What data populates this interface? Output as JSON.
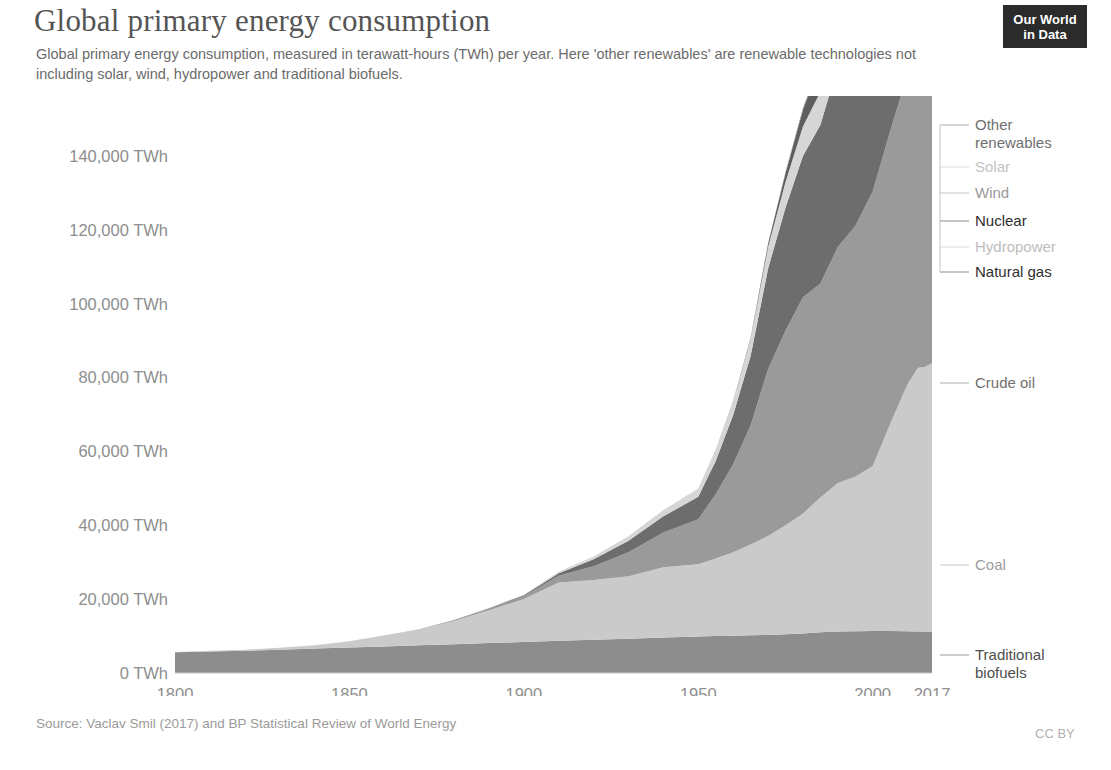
{
  "header": {
    "title": "Global primary energy consumption",
    "subtitle": "Global primary energy consumption, measured in terawatt-hours (TWh) per year. Here 'other renewables' are renewable technologies not including solar, wind, hydropower and traditional biofuels.",
    "logo_line1": "Our World",
    "logo_line2": "in Data"
  },
  "footer": {
    "source": "Source: Vaclav Smil (2017) and BP Statistical Review of World Energy",
    "license": "CC BY"
  },
  "chart_data": {
    "type": "area",
    "title": "Global primary energy consumption",
    "xlabel": "",
    "ylabel": "TWh",
    "xlim": [
      1800,
      2017
    ],
    "ylim": [
      0,
      148000
    ],
    "grid": false,
    "legend_position": "right-inline",
    "ytick_labels": [
      "0 TWh",
      "20,000 TWh",
      "40,000 TWh",
      "60,000 TWh",
      "80,000 TWh",
      "100,000 TWh",
      "120,000 TWh",
      "140,000 TWh"
    ],
    "ytick_values": [
      0,
      20000,
      40000,
      60000,
      80000,
      100000,
      120000,
      140000
    ],
    "xtick_labels": [
      "1800",
      "1850",
      "1900",
      "1950",
      "2000",
      "2017"
    ],
    "xtick_values": [
      1800,
      1850,
      1900,
      1950,
      2000,
      2017
    ],
    "x": [
      1800,
      1810,
      1820,
      1830,
      1840,
      1850,
      1860,
      1870,
      1880,
      1890,
      1900,
      1910,
      1920,
      1930,
      1940,
      1950,
      1955,
      1960,
      1965,
      1970,
      1975,
      1980,
      1985,
      1990,
      1995,
      2000,
      2005,
      2010,
      2013,
      2015,
      2017
    ],
    "series": [
      {
        "name": "Traditional biofuels",
        "color": "#8d8d8d",
        "label_color": "#4d4d4d",
        "values": [
          5600,
          5800,
          6000,
          6300,
          6600,
          6900,
          7200,
          7500,
          7800,
          8100,
          8400,
          8700,
          9000,
          9300,
          9600,
          9900,
          10000,
          10100,
          10200,
          10300,
          10500,
          10700,
          11000,
          11200,
          11300,
          11400,
          11400,
          11300,
          11200,
          11200,
          11200
        ]
      },
      {
        "name": "Coal",
        "color": "#cacaca",
        "label_color": "#9a9a9a",
        "values": [
          97,
          200,
          320,
          520,
          900,
          1700,
          2900,
          4300,
          6300,
          8900,
          11600,
          15800,
          16200,
          16900,
          19000,
          19500,
          21000,
          22600,
          24600,
          26800,
          29500,
          32500,
          36500,
          40200,
          41800,
          44600,
          56000,
          66900,
          71400,
          71600,
          72700
        ]
      },
      {
        "name": "Crude oil",
        "color": "#9a9a9a",
        "label_color": "#7a7a7a",
        "values": [
          0,
          0,
          0,
          0,
          0,
          0,
          30,
          60,
          180,
          420,
          800,
          1800,
          3700,
          6500,
          9400,
          12200,
          17400,
          23800,
          32200,
          45100,
          52600,
          58500,
          57900,
          63900,
          67900,
          74300,
          79200,
          83900,
          87700,
          89800,
          93100
        ]
      },
      {
        "name": "Natural gas",
        "color": "#6d6d6d",
        "label_color": "#3f3f3f",
        "values": [
          0,
          0,
          0,
          0,
          0,
          0,
          0,
          10,
          40,
          110,
          260,
          700,
          1900,
          3100,
          4400,
          6100,
          9000,
          13300,
          18800,
          27200,
          33300,
          38200,
          42900,
          49000,
          52700,
          58200,
          64200,
          72700,
          75900,
          77300,
          81200
        ]
      },
      {
        "name": "Hydropower",
        "color": "#d6d6d6",
        "label_color": "#b9b9b9",
        "values": [
          0,
          0,
          0,
          0,
          0,
          0,
          0,
          0,
          10,
          40,
          140,
          380,
          700,
          1200,
          1700,
          2200,
          2900,
          3700,
          4500,
          5800,
          7000,
          8000,
          9000,
          10200,
          11000,
          11900,
          12800,
          14900,
          15800,
          16200,
          16800
        ]
      },
      {
        "name": "Nuclear",
        "color": "#5e5e5e",
        "label_color": "#2e2e2e",
        "values": [
          0,
          0,
          0,
          0,
          0,
          0,
          0,
          0,
          0,
          0,
          0,
          0,
          0,
          0,
          0,
          0,
          20,
          90,
          300,
          900,
          2300,
          4500,
          7400,
          9800,
          11000,
          11900,
          12500,
          12300,
          11200,
          11400,
          11500
        ]
      },
      {
        "name": "Wind",
        "color": "#b4b4b4",
        "label_color": "#8e8e8e",
        "values": [
          0,
          0,
          0,
          0,
          0,
          0,
          0,
          0,
          0,
          0,
          0,
          0,
          0,
          0,
          0,
          0,
          0,
          0,
          0,
          0,
          0,
          0,
          10,
          30,
          80,
          200,
          600,
          1700,
          3000,
          4100,
          5400
        ]
      },
      {
        "name": "Solar",
        "color": "#dcdcdc",
        "label_color": "#c3c3c3",
        "values": [
          0,
          0,
          0,
          0,
          0,
          0,
          0,
          0,
          0,
          0,
          0,
          0,
          0,
          0,
          0,
          0,
          0,
          0,
          0,
          0,
          0,
          0,
          0,
          0,
          5,
          10,
          40,
          200,
          700,
          1500,
          2400
        ]
      },
      {
        "name": "Other renewables",
        "color": "#8a8a8a",
        "label_color": "#6f6f6f",
        "values": [
          0,
          0,
          0,
          0,
          0,
          0,
          0,
          0,
          0,
          0,
          0,
          0,
          0,
          0,
          0,
          0,
          0,
          0,
          60,
          150,
          300,
          500,
          800,
          1200,
          1600,
          2100,
          2800,
          3800,
          4600,
          5200,
          6000
        ]
      }
    ],
    "legend_entries": [
      {
        "label": "Other renewables",
        "color": "#6f6f6f",
        "y": 125,
        "two_line": true,
        "line2": "renewables",
        "line1": "Other"
      },
      {
        "label": "Solar",
        "color": "#c3c3c3",
        "y": 167,
        "two_line": false
      },
      {
        "label": "Wind",
        "color": "#9a9a9a",
        "y": 193,
        "two_line": false
      },
      {
        "label": "Nuclear",
        "color": "#2e2e2e",
        "y": 221,
        "two_line": false
      },
      {
        "label": "Hydropower",
        "color": "#bdbdbd",
        "y": 247,
        "two_line": false
      },
      {
        "label": "Natural gas",
        "color": "#2e2e2e",
        "y": 272,
        "two_line": false
      },
      {
        "label": "Crude oil",
        "color": "#6f6f6f",
        "y": 383,
        "two_line": false
      },
      {
        "label": "Coal",
        "color": "#9c9c9c",
        "y": 565,
        "two_line": false
      },
      {
        "label": "Traditional biofuels",
        "color": "#4d4d4d",
        "y": 655,
        "two_line": true,
        "line1": "Traditional",
        "line2": "biofuels"
      }
    ]
  }
}
